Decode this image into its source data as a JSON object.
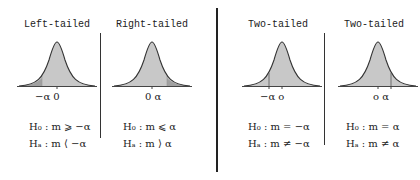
{
  "panels": [
    {
      "title": "Left-tailed",
      "ticks": "−α 0",
      "h0": "H₀ : m  ⩾ −α",
      "ha": "Hₐ : m  ⟨ −α",
      "shaded_tail": "left"
    },
    {
      "title": "Right-tailed",
      "ticks": "0  α",
      "h0": "H₀ : m  ⩽ α",
      "ha": "Hₐ : m  ⟩ α",
      "shaded_tail": "right"
    },
    {
      "title": "Two-tailed",
      "ticks": "−α  o",
      "h0": "H₀ : m = −α",
      "ha": "Hₐ : m ≠ −α",
      "shaded_tail": "none"
    },
    {
      "title": "Two-tailed",
      "ticks": "o  α",
      "h0": "H₀ : m =  α",
      "ha": "Hₐ : m ≠  α",
      "shaded_tail": "none"
    }
  ],
  "colors": {
    "curve_fill": "#c8c8c8",
    "tail_fill": "#a0a0a0",
    "line": "#333333"
  }
}
